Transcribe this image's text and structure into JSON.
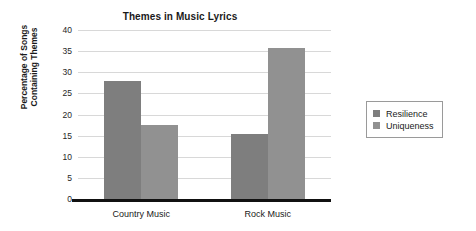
{
  "chart_data": {
    "type": "bar",
    "title": "Themes in Music Lyrics",
    "xlabel": "",
    "ylabel": "Percentage of Songs Containing Themes",
    "ylabel_lines": [
      "Percentage of Songs",
      "Containing Themes"
    ],
    "categories": [
      "Country Music",
      "Rock Music"
    ],
    "series": [
      {
        "name": "Resilience",
        "values": [
          28,
          15.4
        ],
        "color": "#7e7e7e"
      },
      {
        "name": "Uniqueness",
        "values": [
          17.5,
          35.7
        ],
        "color": "#919191"
      }
    ],
    "ylim": [
      0,
      40
    ],
    "yticks": [
      0,
      5,
      10,
      15,
      20,
      25,
      30,
      35,
      40
    ],
    "ytick_labels": [
      "0",
      "5",
      "10",
      "15",
      "20",
      "25",
      "30",
      "35",
      "40"
    ],
    "grid": true,
    "grid_axis": "y",
    "grid_color": "#d8d8d8",
    "legend_position": "right",
    "background_color": "#ffffff",
    "baseline_color": "#111111"
  }
}
